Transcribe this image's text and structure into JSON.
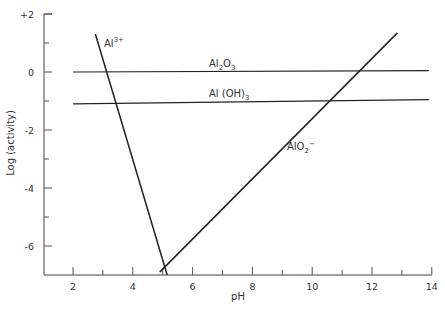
{
  "chart_data": {
    "type": "line",
    "title": "",
    "xlabel": "pH",
    "ylabel": "Log (activity)",
    "xlim": [
      1,
      14
    ],
    "ylim": [
      -7,
      2
    ],
    "x_ticks": [
      "2",
      "4",
      "6",
      "8",
      "10",
      "12",
      "14"
    ],
    "y_ticks": [
      "+2",
      "0",
      "-2",
      "-4",
      "-6"
    ],
    "grid": false,
    "legend": "none (inline labels)",
    "series": [
      {
        "name": "Al3+",
        "label_main": "Al",
        "label_sup": "3+",
        "x": [
          2.75,
          5.15
        ],
        "y": [
          1.3,
          -7.0
        ]
      },
      {
        "name": "Al2O3",
        "label_main": "Al",
        "label_sub1": "2",
        "label_mid": "O",
        "label_sub2": "3",
        "x": [
          2.0,
          13.9
        ],
        "y": [
          0.0,
          0.05
        ]
      },
      {
        "name": "Al(OH)3",
        "label_main": "Al (OH)",
        "label_sub": "3",
        "x": [
          2.0,
          13.9
        ],
        "y": [
          -1.1,
          -0.95
        ]
      },
      {
        "name": "AlO2-",
        "label_main": "AlO",
        "label_sub": "2",
        "label_sup": "−",
        "x": [
          4.9,
          12.85
        ],
        "y": [
          -6.9,
          1.35
        ]
      }
    ]
  }
}
